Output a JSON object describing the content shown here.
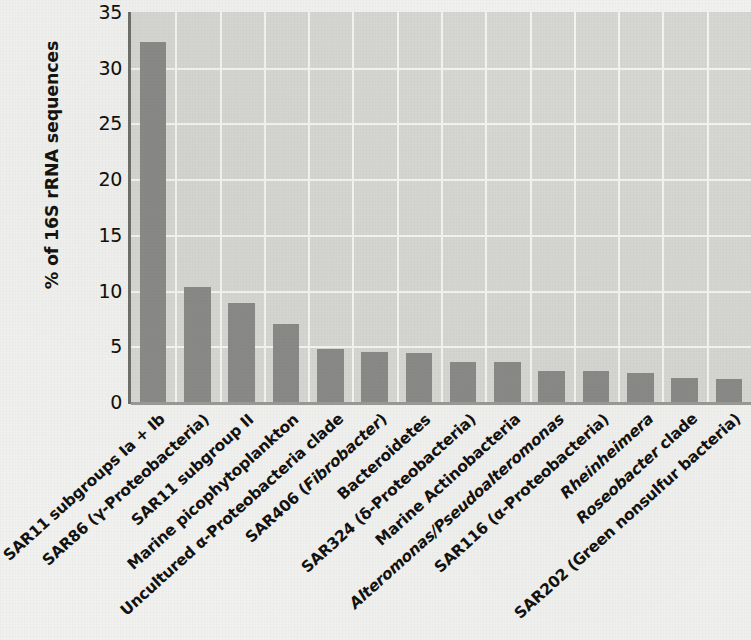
{
  "chart_data": {
    "type": "bar",
    "title": "",
    "xlabel": "",
    "ylabel": "% of 16S rRNA sequences",
    "ylim": [
      0,
      35
    ],
    "yticks": [
      "0",
      "5",
      "10",
      "15",
      "20",
      "25",
      "30",
      "35"
    ],
    "ytick_values": [
      0,
      5,
      10,
      15,
      20,
      25,
      30,
      35
    ],
    "grid": "horizontal and vertical, white gridlines",
    "legend": "none",
    "bar_color": "#8a8a89",
    "plot_background": "#d6d6d3",
    "figure_background": "#f1f1ef",
    "gridline_color": "#f4f4f2",
    "categories": [
      "SAR11 subgroups Ia + Ib",
      "SAR86 (γ-Proteobacteria)",
      "SAR11 subgroup II",
      "Marine picophytoplankton",
      "Uncultured α-Proteobacteria clade",
      "SAR406 (Fibrobacter)",
      "Bacteroidetes",
      "SAR324 (δ-Proteobacteria)",
      "Marine Actinobacteria",
      "Alteromonas/Pseudoalteromonas",
      "SAR116 (α-Proteobacteria)",
      "Rheinheimera",
      "Roseobacter clade",
      "SAR202 (Green nonsulfur bacteria)"
    ],
    "values": [
      32.3,
      10.3,
      8.9,
      7.0,
      4.8,
      4.5,
      4.4,
      3.6,
      3.6,
      2.8,
      2.8,
      2.6,
      2.2,
      2.1
    ]
  },
  "axis": {
    "y_title": "% of 16S rRNA sequences"
  },
  "x_labels": [
    {
      "parts": [
        {
          "text": "SAR11 subgroups Ia + Ib",
          "italic": false
        }
      ]
    },
    {
      "parts": [
        {
          "text": "SAR86 (γ-Proteobacteria)",
          "italic": false
        }
      ]
    },
    {
      "parts": [
        {
          "text": "SAR11 subgroup II",
          "italic": false
        }
      ]
    },
    {
      "parts": [
        {
          "text": "Marine picophytoplankton",
          "italic": false
        }
      ]
    },
    {
      "parts": [
        {
          "text": "Uncultured α-Proteobacteria clade",
          "italic": false
        }
      ]
    },
    {
      "parts": [
        {
          "text": "SAR406 (",
          "italic": false
        },
        {
          "text": "Fibrobacter",
          "italic": true
        },
        {
          "text": ")",
          "italic": false
        }
      ]
    },
    {
      "parts": [
        {
          "text": "Bacteroidetes",
          "italic": false
        }
      ]
    },
    {
      "parts": [
        {
          "text": "SAR324 (δ-Proteobacteria)",
          "italic": false
        }
      ]
    },
    {
      "parts": [
        {
          "text": "Marine Actinobacteria",
          "italic": false
        }
      ]
    },
    {
      "parts": [
        {
          "text": "Alteromonas/Pseudoalteromonas",
          "italic": true
        }
      ]
    },
    {
      "parts": [
        {
          "text": "SAR116 (α-Proteobacteria)",
          "italic": false
        }
      ]
    },
    {
      "parts": [
        {
          "text": "Rheinheimera",
          "italic": true
        }
      ]
    },
    {
      "parts": [
        {
          "text": "Roseobacter",
          "italic": true
        },
        {
          "text": " clade",
          "italic": false
        }
      ]
    },
    {
      "parts": [
        {
          "text": "SAR202 (Green nonsulfur bacteria)",
          "italic": false
        }
      ]
    }
  ]
}
